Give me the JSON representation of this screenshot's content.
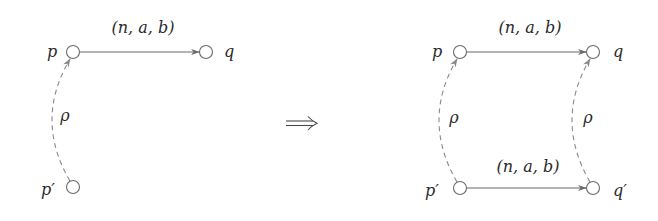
{
  "diagram": {
    "implication_symbol": "⟹",
    "left": {
      "nodes": [
        {
          "id": "p",
          "label": "p",
          "x": 73,
          "y": 52
        },
        {
          "id": "q",
          "label": "q",
          "x": 206,
          "y": 52
        },
        {
          "id": "p_prime",
          "label": "p′",
          "x": 73,
          "y": 187
        }
      ],
      "edges": [
        {
          "from": "p",
          "to": "q",
          "style": "solid",
          "label": "(n, a, b)"
        },
        {
          "from": "p_prime",
          "to": "p",
          "style": "dashed",
          "label": "ρ"
        }
      ]
    },
    "right": {
      "nodes": [
        {
          "id": "p",
          "label": "p",
          "x": 460,
          "y": 52
        },
        {
          "id": "q",
          "label": "q",
          "x": 593,
          "y": 52
        },
        {
          "id": "p_prime",
          "label": "p′",
          "x": 460,
          "y": 188
        },
        {
          "id": "q_prime",
          "label": "q′",
          "x": 593,
          "y": 188
        }
      ],
      "edges": [
        {
          "from": "p",
          "to": "q",
          "style": "solid",
          "label": "(n, a, b)"
        },
        {
          "from": "p_prime",
          "to": "q_prime",
          "style": "solid",
          "label": "(n, a, b)"
        },
        {
          "from": "p_prime",
          "to": "p",
          "style": "dashed",
          "label": "ρ"
        },
        {
          "from": "q_prime",
          "to": "q",
          "style": "dashed",
          "label": "ρ"
        }
      ]
    }
  },
  "labels": {
    "left_p": "p",
    "left_q": "q",
    "left_p_prime": "p′",
    "left_edge_pq": "(n, a, b)",
    "left_rho": "ρ",
    "right_p": "p",
    "right_q": "q",
    "right_p_prime": "p′",
    "right_q_prime": "q′",
    "right_edge_pq": "(n, a, b)",
    "right_edge_pq_prime": "(n, a, b)",
    "right_rho_left": "ρ",
    "right_rho_right": "ρ"
  }
}
